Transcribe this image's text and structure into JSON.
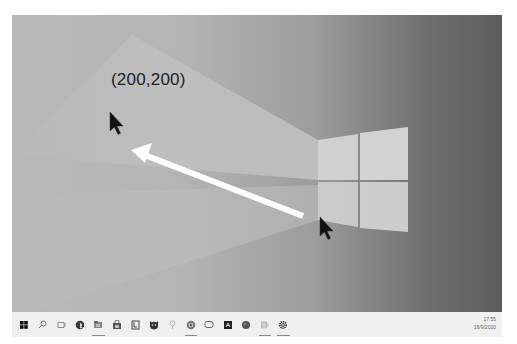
{
  "desktop": {
    "wallpaper": "windows-10-light-beam",
    "colors": {
      "bg_left": "#b9b9b9",
      "bg_right": "#5c5c5c",
      "logo": "#d8d8d8"
    }
  },
  "annotation": {
    "label": "(200,200)",
    "arrow_from": [
      303,
      217
    ],
    "arrow_to": [
      131,
      150
    ],
    "arrow_color": "#ffffff"
  },
  "cursors": [
    {
      "name": "target-cursor",
      "x": 110,
      "y": 112
    },
    {
      "name": "current-cursor",
      "x": 320,
      "y": 217
    }
  ],
  "taskbar": {
    "items": [
      {
        "name": "start-button",
        "icon": "windows-icon",
        "running": false
      },
      {
        "name": "search-button",
        "icon": "search-icon",
        "running": false
      },
      {
        "name": "task-view-button",
        "icon": "task-view-icon",
        "running": false
      },
      {
        "name": "edge-button",
        "icon": "edge-icon",
        "running": false
      },
      {
        "name": "file-explorer-button",
        "icon": "folder-icon",
        "running": true
      },
      {
        "name": "store-button",
        "icon": "store-icon",
        "running": false
      },
      {
        "name": "notes-app-button",
        "icon": "notebook-icon",
        "running": false
      },
      {
        "name": "shield-app-button",
        "icon": "shield-icon",
        "running": false
      },
      {
        "name": "tips-button",
        "icon": "lightbulb-icon",
        "running": false
      },
      {
        "name": "chrome-button",
        "icon": "browser-icon",
        "running": true
      },
      {
        "name": "chat-app-button",
        "icon": "chat-icon",
        "running": false
      },
      {
        "name": "acrobat-button",
        "icon": "pdf-icon",
        "running": false
      },
      {
        "name": "media-app-button",
        "icon": "circle-app-icon",
        "running": false
      },
      {
        "name": "volume-app-button",
        "icon": "speaker-icon",
        "running": true
      },
      {
        "name": "settings-button",
        "icon": "gear-icon",
        "running": true
      }
    ],
    "clock": {
      "time": "17:55",
      "date": "16/9/2020"
    }
  }
}
